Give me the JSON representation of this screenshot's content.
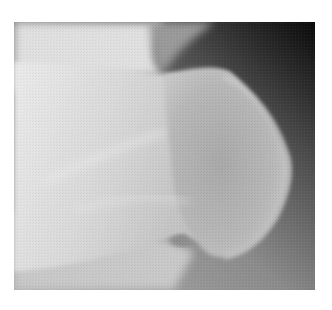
{
  "figure": {
    "kind": "radiograph",
    "description": "Grayscale X-ray of a bone end (rounded articular head) against dark soft-tissue background",
    "colors": {
      "bone_light": "#e6e6e6",
      "bone_mid": "#c4c4c4",
      "head": "#b4b4b4",
      "soft_tissue": "#7a7a7a",
      "background_dark": "#0e0e0e",
      "page_bg": "#ffffff"
    }
  }
}
